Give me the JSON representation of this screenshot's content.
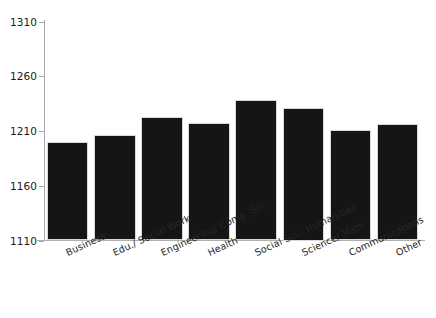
{
  "chart_data": {
    "type": "bar",
    "title": "",
    "subtitle": "",
    "xlabel": "",
    "ylabel": "",
    "categories": [
      "Business",
      "Edu./ Social Work",
      "Engineering/ Comp. Sci.",
      "Health",
      "Social Sci./ Humanities",
      "Science/ Math",
      "Communications",
      "Other"
    ],
    "values": [
      1200,
      1206,
      1223,
      1217,
      1238,
      1231,
      1211,
      1216
    ],
    "ylim": [
      1110,
      1310
    ],
    "ytick_labels": [
      "1310",
      "1260",
      "1210",
      "1160",
      "1110"
    ],
    "yticks": [
      1310,
      1260,
      1210,
      1160,
      1110
    ],
    "grid": false,
    "legend": false,
    "bar_color": "#151515",
    "axis_color": "#a8a8a8",
    "background": "#ffffff",
    "label_rotation_deg": -25
  }
}
